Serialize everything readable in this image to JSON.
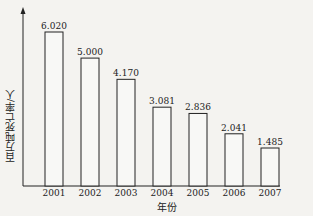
{
  "chart_data": {
    "type": "bar",
    "title": "",
    "xlabel": "年份",
    "ylabel": "百万吨死亡率/人",
    "categories": [
      "2001",
      "2002",
      "2003",
      "2004",
      "2005",
      "2006",
      "2007"
    ],
    "values": [
      6.02,
      5.0,
      4.17,
      3.081,
      2.836,
      2.041,
      1.485
    ],
    "value_labels": [
      "6.020",
      "5.000",
      "4.170",
      "3.081",
      "2.836",
      "2.041",
      "1.485"
    ],
    "ylim": [
      0,
      7
    ],
    "grid": false,
    "legend": null,
    "bar_fill": "#f8f8f6",
    "bar_stroke": "#222222"
  }
}
